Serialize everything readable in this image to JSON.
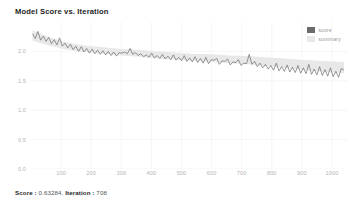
{
  "widget": {
    "title": "Model Score vs. Iteration",
    "background": "#ffffff"
  },
  "legend": {
    "position": "top-right",
    "items": [
      {
        "label": "score",
        "color": "#6b6b6b",
        "swatch": "legend-swatch-score"
      },
      {
        "label": "summary",
        "color": "#e8e8e8",
        "swatch": "legend-swatch-summary"
      }
    ]
  },
  "footer": {
    "score_label": "Score :",
    "score_value": "0.63284,",
    "iteration_label": "Iteration :",
    "iteration_value": "708",
    "full_text": "Score : 0.63284, Iteration : 708"
  },
  "chart_data": {
    "type": "line",
    "title": "Model Score vs. Iteration",
    "xlabel": "",
    "ylabel": "",
    "grid": true,
    "grid_color": "#f2f2f2",
    "xlim": [
      0,
      1050
    ],
    "ylim": [
      0.0,
      2.5
    ],
    "yticks": [
      0.0,
      0.5,
      1.0,
      1.5,
      2.0
    ],
    "ytick_labels": [
      "0.0",
      "0.5",
      "1.0",
      "1.5",
      "2.0"
    ],
    "xticks": [
      100,
      200,
      300,
      400,
      500,
      600,
      700,
      800,
      900,
      1000
    ],
    "xtick_labels": [
      "100",
      "200",
      "300",
      "400",
      "500",
      "600",
      "700",
      "800",
      "900",
      "1000"
    ],
    "series": [
      {
        "name": "score",
        "color": "#6b6b6b",
        "width": 0.7,
        "x": [
          5,
          14,
          23,
          32,
          41,
          50,
          59,
          68,
          77,
          86,
          95,
          104,
          113,
          122,
          131,
          140,
          149,
          158,
          167,
          176,
          185,
          194,
          203,
          212,
          221,
          230,
          239,
          248,
          257,
          266,
          275,
          284,
          293,
          302,
          311,
          320,
          329,
          338,
          347,
          356,
          365,
          374,
          383,
          392,
          401,
          410,
          419,
          428,
          437,
          446,
          455,
          464,
          473,
          482,
          491,
          500,
          509,
          518,
          527,
          536,
          545,
          554,
          563,
          572,
          581,
          590,
          599,
          608,
          617,
          626,
          635,
          644,
          653,
          662,
          671,
          680,
          689,
          698,
          707,
          716,
          725,
          734,
          743,
          752,
          761,
          770,
          779,
          788,
          797,
          806,
          815,
          824,
          833,
          842,
          851,
          860,
          869,
          878,
          887,
          896,
          905,
          914,
          923,
          932,
          941,
          950,
          959,
          968,
          977,
          986,
          995,
          1004,
          1013,
          1022,
          1031,
          1040
        ],
        "y": [
          2.3,
          2.22,
          2.34,
          2.19,
          2.26,
          2.17,
          2.24,
          2.13,
          2.2,
          2.11,
          2.23,
          2.09,
          2.14,
          2.06,
          2.12,
          2.03,
          2.09,
          2.0,
          2.08,
          1.99,
          2.05,
          1.97,
          2.04,
          1.96,
          2.02,
          1.95,
          2.01,
          1.94,
          2.0,
          1.93,
          1.99,
          1.92,
          1.98,
          1.97,
          1.99,
          1.96,
          2.05,
          1.95,
          1.98,
          1.93,
          1.96,
          1.91,
          1.94,
          1.9,
          1.97,
          1.89,
          1.93,
          1.88,
          1.95,
          1.87,
          1.92,
          1.86,
          1.94,
          1.85,
          1.9,
          1.84,
          1.93,
          1.83,
          1.89,
          1.82,
          1.91,
          1.81,
          1.88,
          1.8,
          1.9,
          1.79,
          1.86,
          1.85,
          1.88,
          1.78,
          1.84,
          1.83,
          1.87,
          1.77,
          1.82,
          1.81,
          1.86,
          1.76,
          1.8,
          1.79,
          1.95,
          1.78,
          1.83,
          1.74,
          1.8,
          1.72,
          1.78,
          1.7,
          1.76,
          1.68,
          1.8,
          1.67,
          1.74,
          1.66,
          1.77,
          1.65,
          1.73,
          1.64,
          1.76,
          1.63,
          1.72,
          1.62,
          1.78,
          1.61,
          1.7,
          1.6,
          1.74,
          1.59,
          1.69,
          1.58,
          1.72,
          1.57,
          1.66,
          1.56,
          1.71,
          1.68
        ]
      },
      {
        "name": "summary",
        "color": "#e8e8e8",
        "type": "band",
        "x": [
          5,
          60,
          120,
          180,
          240,
          300,
          360,
          420,
          480,
          540,
          600,
          660,
          720,
          780,
          840,
          900,
          960,
          1040
        ],
        "y_upper": [
          2.36,
          2.24,
          2.15,
          2.1,
          2.07,
          2.04,
          2.03,
          2.0,
          1.98,
          1.96,
          1.95,
          1.93,
          1.92,
          1.9,
          1.88,
          1.86,
          1.84,
          1.82
        ],
        "y_lower": [
          2.18,
          2.1,
          2.03,
          1.99,
          1.96,
          1.93,
          1.91,
          1.88,
          1.86,
          1.84,
          1.82,
          1.8,
          1.78,
          1.75,
          1.72,
          1.69,
          1.66,
          1.63
        ]
      }
    ]
  }
}
